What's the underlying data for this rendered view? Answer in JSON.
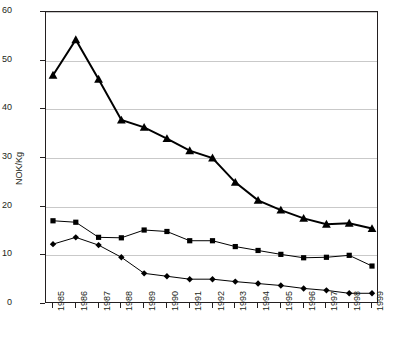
{
  "chart_data": {
    "type": "line",
    "title": "",
    "xlabel": "",
    "ylabel": "NOK/Kg",
    "ylim": [
      0,
      60
    ],
    "ytick_values": [
      0,
      10,
      20,
      30,
      40,
      50,
      60
    ],
    "ytick_labels": [
      "0",
      "10",
      "20",
      "30",
      "40",
      "50",
      "60"
    ],
    "grid": true,
    "legend": "none",
    "categories": [
      "1985",
      "1986",
      "1987",
      "1988",
      "1989",
      "1990",
      "1991",
      "1992",
      "1993",
      "1994",
      "1995",
      "1996",
      "1997",
      "1998",
      "1999"
    ],
    "series": [
      {
        "name": "series-triangle",
        "marker": "triangle",
        "color": "#000000",
        "line_width": 2,
        "values": [
          47.0,
          54.3,
          46.2,
          37.8,
          36.3,
          34.0,
          31.5,
          30.0,
          25.0,
          21.3,
          19.3,
          17.6,
          16.4,
          16.6,
          15.5
        ]
      },
      {
        "name": "series-square",
        "marker": "square",
        "color": "#000000",
        "line_width": 1,
        "values": [
          17.1,
          16.8,
          13.7,
          13.6,
          15.2,
          14.9,
          13.0,
          13.0,
          11.8,
          11.0,
          10.2,
          9.5,
          9.6,
          10.0,
          7.8
        ]
      },
      {
        "name": "series-diamond",
        "marker": "diamond",
        "color": "#000000",
        "line_width": 1,
        "values": [
          12.3,
          13.7,
          12.1,
          9.6,
          6.3,
          5.7,
          5.1,
          5.1,
          4.6,
          4.2,
          3.8,
          3.2,
          2.8,
          2.2,
          2.2
        ]
      }
    ]
  }
}
